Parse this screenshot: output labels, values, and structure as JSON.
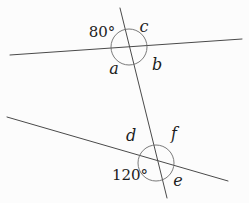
{
  "figure": {
    "width": 249,
    "height": 203,
    "background_color": "#fcfcfc",
    "line_color": "#4a4a4a",
    "circle_color": "#6b6b6b",
    "text_color": "#1c1c1c",
    "lines": [
      {
        "name": "top-line",
        "x1": 10,
        "y1": 55,
        "x2": 242,
        "y2": 39
      },
      {
        "name": "bottom-line",
        "x1": 7,
        "y1": 117,
        "x2": 228,
        "y2": 181
      },
      {
        "name": "transversal-line",
        "x1": 120,
        "y1": 8,
        "x2": 167,
        "y2": 198
      }
    ],
    "angle_circles": [
      {
        "name": "top-intersection-angle-circle",
        "cx": 129,
        "cy": 47,
        "r": 18
      },
      {
        "name": "bottom-intersection-angle-circle",
        "cx": 156,
        "cy": 163,
        "r": 18
      }
    ],
    "labels": [
      {
        "name": "angle-label-80",
        "text": "80°",
        "x": 102,
        "y": 32,
        "italic": false,
        "size": 15
      },
      {
        "name": "angle-label-c",
        "text": "c",
        "x": 144,
        "y": 26,
        "italic": true,
        "size": 16
      },
      {
        "name": "angle-label-a",
        "text": "a",
        "x": 114,
        "y": 68,
        "italic": true,
        "size": 16
      },
      {
        "name": "angle-label-b",
        "text": "b",
        "x": 157,
        "y": 64,
        "italic": true,
        "size": 16
      },
      {
        "name": "angle-label-d",
        "text": "d",
        "x": 131,
        "y": 135,
        "italic": true,
        "size": 16
      },
      {
        "name": "angle-label-f",
        "text": "f",
        "x": 174,
        "y": 133,
        "italic": true,
        "size": 16
      },
      {
        "name": "angle-label-120",
        "text": "120°",
        "x": 130,
        "y": 175,
        "italic": false,
        "size": 15
      },
      {
        "name": "angle-label-e",
        "text": "e",
        "x": 178,
        "y": 180,
        "italic": true,
        "size": 16
      }
    ]
  }
}
